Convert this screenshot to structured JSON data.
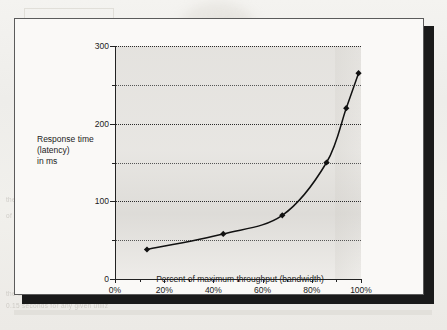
{
  "figure": {
    "y_axis_title_lines": [
      "Response time",
      "(latency)",
      "in ms"
    ],
    "x_axis_title": "Percent of maximum throughput (bandwidth)"
  },
  "chart_data": {
    "type": "line",
    "title": "",
    "xlabel": "Percent of maximum throughput (bandwidth)",
    "ylabel": "Response time (latency) in ms",
    "xlim": [
      0,
      100
    ],
    "ylim": [
      0,
      300
    ],
    "grid": true,
    "legend": "none",
    "x_ticks": [
      "0%",
      "20%",
      "40%",
      "60%",
      "80%",
      "100%"
    ],
    "x_tick_values": [
      0,
      20,
      40,
      60,
      80,
      100
    ],
    "y_ticks": [
      "0",
      "100",
      "200",
      "300"
    ],
    "y_tick_values": [
      0,
      100,
      200,
      300
    ],
    "y_minor_gridlines": [
      50,
      150,
      250
    ],
    "series": [
      {
        "name": "Response time",
        "marker": "filled-diamond",
        "x": [
          13,
          44,
          68,
          86,
          94,
          99
        ],
        "values": [
          38,
          58,
          82,
          150,
          220,
          265
        ]
      }
    ]
  },
  "scan_artifacts": {
    "bleed_text": [
      "FIGURE 2.18   The relationship",
      "component? relationships between",
      "the relationship between latency and utiliz",
      "of a given service time and a utiliz",
      "the time to enter and",
      "0.15 seconds for any given utiliz"
    ]
  }
}
